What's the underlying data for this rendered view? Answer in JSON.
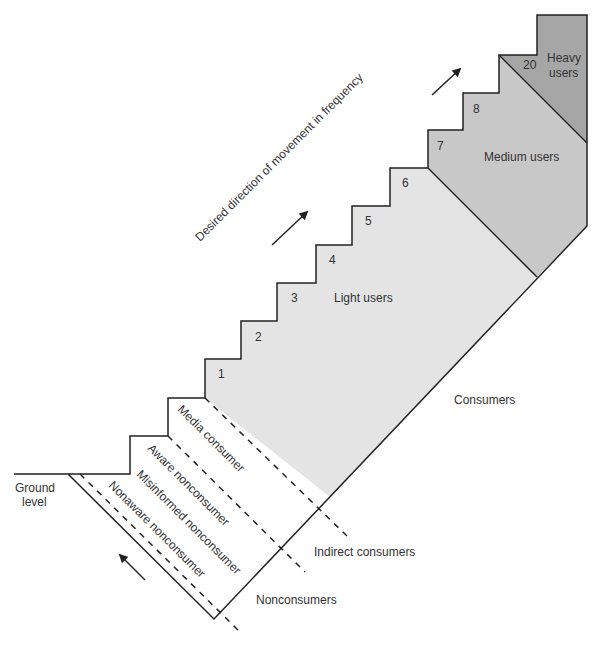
{
  "title": "Desired direction of movement in frequency",
  "colors": {
    "light_users_fill": "#e4e4e4",
    "medium_users_fill": "#c8c8c8",
    "heavy_users_fill": "#a6a6a6",
    "line": "#222222",
    "text": "#333333"
  },
  "segments": {
    "heavy": "Heavy",
    "heavy2": "users",
    "medium": "Medium users",
    "light": "Light users"
  },
  "steps": [
    "1",
    "2",
    "3",
    "4",
    "5",
    "6",
    "7",
    "8",
    "20"
  ],
  "nonconsumer_bands": {
    "media": "Media consumer",
    "aware": "Aware nonconsumer",
    "misinformed": "Misinformed nonconsumer",
    "nonaware": "Nonaware nonconsumer"
  },
  "groups": {
    "consumers": "Consumers",
    "indirect": "Indirect consumers",
    "nonconsumers": "Nonconsumers"
  },
  "ground": {
    "line1": "Ground",
    "line2": "level"
  },
  "icons": [
    "arrow-up-right-icon",
    "arrow-up-right-icon",
    "arrow-up-left-icon"
  ]
}
